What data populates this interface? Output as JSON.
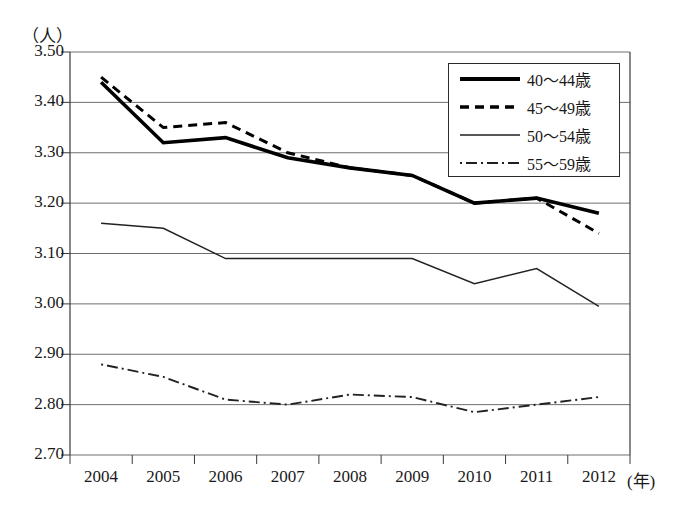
{
  "axis": {
    "y_unit_label": "（人）",
    "x_unit_label": "(年)",
    "y_ticks": [
      "3.50",
      "3.40",
      "3.30",
      "3.20",
      "3.10",
      "3.00",
      "2.90",
      "2.80",
      "2.70"
    ],
    "x_ticks": [
      "2004",
      "2005",
      "2006",
      "2007",
      "2008",
      "2009",
      "2010",
      "2011",
      "2012"
    ]
  },
  "legend": {
    "items": [
      {
        "label": "40〜44歳",
        "style": "thick-solid"
      },
      {
        "label": "45〜49歳",
        "style": "dashed"
      },
      {
        "label": "50〜54歳",
        "style": "thin-solid"
      },
      {
        "label": "55〜59歳",
        "style": "dash-dot"
      }
    ]
  },
  "chart_data": {
    "type": "line",
    "title": "",
    "xlabel": "(年)",
    "ylabel": "（人）",
    "ylim": [
      2.7,
      3.5
    ],
    "ytick_step": 0.1,
    "grid": true,
    "legend_position": "top-right",
    "categories": [
      "2004",
      "2005",
      "2006",
      "2007",
      "2008",
      "2009",
      "2010",
      "2011",
      "2012"
    ],
    "x": [
      2004,
      2005,
      2006,
      2007,
      2008,
      2009,
      2010,
      2011,
      2012
    ],
    "series": [
      {
        "name": "40〜44歳",
        "style": "thick-solid",
        "color": "#000000",
        "values": [
          3.44,
          3.32,
          3.33,
          3.29,
          3.27,
          3.255,
          3.2,
          3.21,
          3.18
        ]
      },
      {
        "name": "45〜49歳",
        "style": "dashed",
        "color": "#000000",
        "values": [
          3.45,
          3.35,
          3.36,
          3.3,
          3.27,
          3.255,
          3.2,
          3.21,
          3.14
        ]
      },
      {
        "name": "50〜54歳",
        "style": "thin-solid",
        "color": "#222222",
        "values": [
          3.16,
          3.15,
          3.09,
          3.09,
          3.09,
          3.09,
          3.04,
          3.07,
          2.995
        ]
      },
      {
        "name": "55〜59歳",
        "style": "dash-dot",
        "color": "#222222",
        "values": [
          2.88,
          2.855,
          2.81,
          2.8,
          2.82,
          2.815,
          2.785,
          2.8,
          2.815
        ]
      }
    ]
  },
  "colors": {
    "axis": "#3a3a3a",
    "grid": "#6e6e6e",
    "ink": "#111111",
    "background": "#ffffff"
  }
}
